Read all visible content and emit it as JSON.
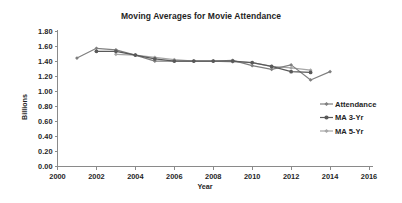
{
  "chart_data": {
    "type": "line",
    "title": "Moving Averages for Movie Attendance",
    "xlabel": "Year",
    "ylabel": "Billions",
    "xlim": [
      2000,
      2016
    ],
    "ylim": [
      0.0,
      1.8
    ],
    "xticks": [
      2000,
      2002,
      2004,
      2006,
      2008,
      2010,
      2012,
      2014,
      2016
    ],
    "yticks": [
      "0.00",
      "0.20",
      "0.40",
      "0.60",
      "0.80",
      "1.00",
      "1.20",
      "1.40",
      "1.60",
      "1.80"
    ],
    "grid": false,
    "legend_position": "right",
    "series": [
      {
        "name": "Attendance",
        "color": "#7f7f7f",
        "marker": "diamond",
        "x": [
          2001,
          2002,
          2003,
          2004,
          2005,
          2006,
          2007,
          2008,
          2009,
          2010,
          2011,
          2012,
          2013,
          2014
        ],
        "values": [
          1.44,
          1.57,
          1.55,
          1.48,
          1.4,
          1.4,
          1.4,
          1.4,
          1.41,
          1.34,
          1.29,
          1.35,
          1.15,
          1.26
        ]
      },
      {
        "name": "MA 3-Yr",
        "color": "#595959",
        "marker": "circle",
        "x": [
          2002,
          2003,
          2004,
          2005,
          2006,
          2007,
          2008,
          2009,
          2010,
          2011,
          2012,
          2013
        ],
        "values": [
          1.53,
          1.53,
          1.48,
          1.43,
          1.4,
          1.4,
          1.4,
          1.4,
          1.38,
          1.33,
          1.26,
          1.25
        ]
      },
      {
        "name": "MA 5-Yr",
        "color": "#a6a6a6",
        "marker": "diamond",
        "x": [
          2003,
          2004,
          2005,
          2006,
          2007,
          2008,
          2009,
          2010,
          2011,
          2012,
          2013
        ],
        "values": [
          1.49,
          1.48,
          1.45,
          1.42,
          1.4,
          1.4,
          1.39,
          1.38,
          1.33,
          1.31,
          1.28
        ]
      }
    ],
    "legend_entries": [
      {
        "label": "Attendance",
        "color": "#7f7f7f"
      },
      {
        "label": "MA 3-Yr",
        "color": "#595959"
      },
      {
        "label": "MA 5-Yr",
        "color": "#a6a6a6"
      }
    ]
  }
}
